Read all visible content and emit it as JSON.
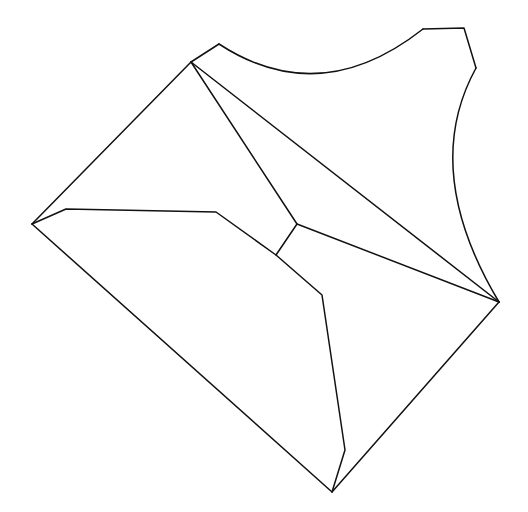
{
  "diagram": {
    "type": "line-drawing",
    "background": "#ffffff",
    "stroke_color": "#111111",
    "stroke_width": 1.5,
    "paths": [
      {
        "name": "outer-left-upper-edge",
        "d": "M32,224 L191,62 L219,44"
      },
      {
        "name": "top-arc",
        "d": "M219,44 Q320,110 423,29"
      },
      {
        "name": "top-right-notch",
        "d": "M423,29 L464,28 L476,68"
      },
      {
        "name": "right-arc",
        "d": "M476,68 Q420,170 499,302"
      },
      {
        "name": "outer-lower-edges",
        "d": "M499,302 L332,492 L32,224"
      },
      {
        "name": "inner-flap",
        "d": "M32,224 L66,209 L216,212 L276,255 L322,295 L345,450 L332,492"
      },
      {
        "name": "diagonal-fold-upper",
        "d": "M191,62 L297,224 L499,302"
      },
      {
        "name": "diagonal-fold-main",
        "d": "M191,62 L499,302"
      },
      {
        "name": "short-connector-fold",
        "d": "M297,224 L276,255"
      }
    ]
  }
}
